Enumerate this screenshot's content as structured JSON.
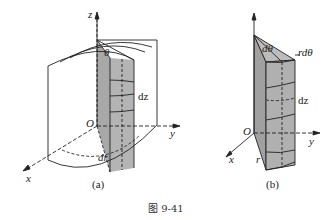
{
  "figure": {
    "caption": "图 9-41",
    "colors": {
      "line": "#222222",
      "shade": "#a8a8a8",
      "shade_dark": "#8c8c8c",
      "background": "#ffffff"
    },
    "panel_a": {
      "label": "(a)",
      "axes": {
        "z": "z",
        "y": "y",
        "x": "x",
        "origin": "O"
      },
      "annotations": {
        "angle": "θ",
        "height_element": "dz",
        "radial_element": "dr"
      }
    },
    "panel_b": {
      "label": "(b)",
      "axes": {
        "y": "y",
        "x": "x",
        "origin": "O"
      },
      "annotations": {
        "angle_element": "dθ",
        "arc_element": "rdθ",
        "height_element": "dz",
        "radius": "r"
      }
    }
  }
}
